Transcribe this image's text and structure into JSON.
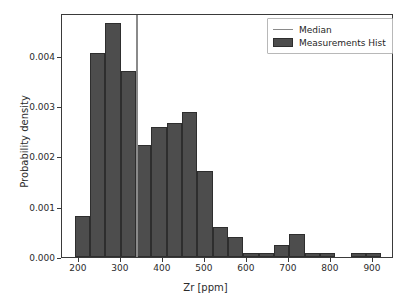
{
  "chart_data": {
    "type": "bar",
    "title": "",
    "xlabel": "Zr [ppm]",
    "ylabel": "Probability density",
    "xlim": [
      160,
      950
    ],
    "ylim": [
      0.0,
      0.00485
    ],
    "grid": false,
    "legend_position": "upper right",
    "bin_width": 36.5,
    "bin_edges": [
      190,
      226.5,
      263,
      299.5,
      336,
      372.5,
      409,
      445.5,
      482,
      518.5,
      555,
      591.5,
      628,
      664.5,
      701,
      737.5,
      774,
      810.5,
      847,
      883.5,
      920
    ],
    "categories": [
      "190-227",
      "227-263",
      "263-300",
      "300-336",
      "336-373",
      "373-409",
      "409-446",
      "446-482",
      "482-519",
      "519-555",
      "555-592",
      "592-628",
      "628-665",
      "665-701",
      "701-738",
      "738-774",
      "774-811",
      "811-847",
      "847-884",
      "884-920"
    ],
    "values": [
      0.00082,
      0.00405,
      0.00465,
      0.00369,
      0.00222,
      0.00258,
      0.00266,
      0.00289,
      0.00171,
      0.0006,
      0.00039,
      8e-05,
      8e-05,
      0.00024,
      0.00046,
      8e-05,
      8e-05,
      0.0,
      8e-05,
      8e-05
    ],
    "annotations": [
      {
        "name": "median",
        "type": "vline",
        "x": 337,
        "label": "Median"
      }
    ],
    "series": [
      {
        "name": "Measurements Hist",
        "color": "#4d4d4d",
        "edge_color": "#2e2e2e"
      }
    ],
    "xticks": [
      200,
      300,
      400,
      500,
      600,
      700,
      800,
      900
    ],
    "xtick_labels": [
      "200",
      "300",
      "400",
      "500",
      "600",
      "700",
      "800",
      "900"
    ],
    "yticks": [
      0.0,
      0.001,
      0.002,
      0.003,
      0.004
    ],
    "ytick_labels": [
      "0.000",
      "0.001",
      "0.002",
      "0.003",
      "0.004"
    ]
  },
  "legend": {
    "items": [
      {
        "label": "Median",
        "marker": "line",
        "color": "#8a8a8a"
      },
      {
        "label": "Measurements Hist",
        "marker": "patch",
        "color": "#4d4d4d"
      }
    ]
  },
  "colors": {
    "bar_fill": "#4d4d4d",
    "bar_edge": "#2e2e2e",
    "median_line": "#8a8a8a",
    "axis": "#3a3a3a",
    "text": "#2b2b2b",
    "background": "#ffffff"
  }
}
